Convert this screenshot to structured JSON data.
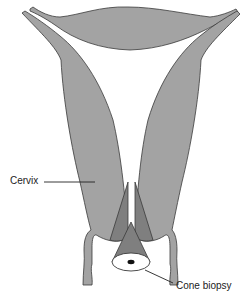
{
  "diagram": {
    "type": "anatomical-illustration",
    "labels": {
      "cervix": "Cervix",
      "cone_biopsy": "Cone biopsy"
    },
    "colors": {
      "tissue_fill": "#a3a3a3",
      "cone_fill": "#7f7f7f",
      "outline": "#3a3a3a",
      "background": "#ffffff",
      "leader_line": "#222222"
    }
  }
}
